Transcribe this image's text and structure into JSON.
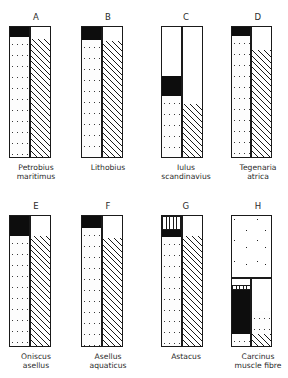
{
  "figure": {
    "type": "stacked-bar-panels",
    "panel_count": 8,
    "columns_per_panel": 2,
    "axis_range_percent": [
      0,
      100
    ]
  },
  "chart_data": {
    "type": "bar",
    "title": "",
    "subtitle": "",
    "xlabel": "",
    "ylabel": "",
    "ylim": [
      0,
      100
    ],
    "grid": false,
    "legend": [],
    "orientation": "vertical-stacked",
    "panels": [
      {
        "letter": "A",
        "species_lines": [
          "Petrobius",
          "maritimus"
        ],
        "columns": [
          {
            "side": "left",
            "segments": [
              {
                "fill": "black",
                "from": 92,
                "to": 100
              },
              {
                "fill": "stipple",
                "from": 0,
                "to": 92
              }
            ]
          },
          {
            "side": "right",
            "segments": [
              {
                "fill": "white",
                "from": 91,
                "to": 100
              },
              {
                "fill": "hatch",
                "from": 0,
                "to": 91
              }
            ]
          }
        ]
      },
      {
        "letter": "B",
        "species_lines": [
          "Lithobius"
        ],
        "columns": [
          {
            "side": "left",
            "segments": [
              {
                "fill": "black",
                "from": 90,
                "to": 100
              },
              {
                "fill": "stipple",
                "from": 0,
                "to": 90
              }
            ]
          },
          {
            "side": "right",
            "segments": [
              {
                "fill": "white",
                "from": 89,
                "to": 100
              },
              {
                "fill": "hatch",
                "from": 0,
                "to": 89
              }
            ]
          }
        ]
      },
      {
        "letter": "C",
        "species_lines": [
          "Iulus",
          "scandinavius"
        ],
        "columns": [
          {
            "side": "left",
            "segments": [
              {
                "fill": "white",
                "from": 62,
                "to": 100
              },
              {
                "fill": "black",
                "from": 47,
                "to": 62
              },
              {
                "fill": "stipple",
                "from": 0,
                "to": 47
              }
            ]
          },
          {
            "side": "right",
            "segments": [
              {
                "fill": "white",
                "from": 41,
                "to": 100
              },
              {
                "fill": "hatch",
                "from": 0,
                "to": 41
              }
            ]
          }
        ]
      },
      {
        "letter": "D",
        "species_lines": [
          "Tegenaria",
          "atrica"
        ],
        "columns": [
          {
            "side": "left",
            "segments": [
              {
                "fill": "black",
                "from": 93,
                "to": 100
              },
              {
                "fill": "stipple",
                "from": 0,
                "to": 93
              }
            ]
          },
          {
            "side": "right",
            "segments": [
              {
                "fill": "white",
                "from": 82,
                "to": 100
              },
              {
                "fill": "hatch",
                "from": 0,
                "to": 82
              }
            ]
          }
        ]
      },
      {
        "letter": "E",
        "species_lines": [
          "Oniscus",
          "asellus"
        ],
        "columns": [
          {
            "side": "left",
            "segments": [
              {
                "fill": "black",
                "from": 85,
                "to": 100
              },
              {
                "fill": "stipple",
                "from": 0,
                "to": 85
              }
            ]
          },
          {
            "side": "right",
            "segments": [
              {
                "fill": "white",
                "from": 85,
                "to": 100
              },
              {
                "fill": "hatch",
                "from": 0,
                "to": 85
              }
            ]
          }
        ]
      },
      {
        "letter": "F",
        "species_lines": [
          "Asellus",
          "aquaticus"
        ],
        "columns": [
          {
            "side": "left",
            "segments": [
              {
                "fill": "black",
                "from": 91,
                "to": 100
              },
              {
                "fill": "stipple",
                "from": 0,
                "to": 91
              }
            ]
          },
          {
            "side": "right",
            "segments": [
              {
                "fill": "white",
                "from": 83,
                "to": 100
              },
              {
                "fill": "hatch",
                "from": 0,
                "to": 83
              }
            ]
          }
        ]
      },
      {
        "letter": "G",
        "species_lines": [
          "Astacus"
        ],
        "columns": [
          {
            "side": "left",
            "segments": [
              {
                "fill": "check",
                "from": 89,
                "to": 100
              },
              {
                "fill": "black",
                "from": 84,
                "to": 89
              },
              {
                "fill": "stipple",
                "from": 0,
                "to": 84
              }
            ]
          },
          {
            "side": "right",
            "segments": [
              {
                "fill": "white",
                "from": 85,
                "to": 100
              },
              {
                "fill": "hatch",
                "from": 0,
                "to": 85
              }
            ]
          }
        ]
      },
      {
        "letter": "H",
        "species_lines": [
          "Carcinus",
          "muscle fibre"
        ],
        "full_width_top": {
          "fill": "sparse",
          "from": 52,
          "to": 100
        },
        "divider_at": 52,
        "columns": [
          {
            "side": "left",
            "segments": [
              {
                "fill": "check",
                "from": 44,
                "to": 48
              },
              {
                "fill": "black",
                "from": 9,
                "to": 44
              },
              {
                "fill": "stipple",
                "from": 0,
                "to": 9
              }
            ]
          },
          {
            "side": "right",
            "segments": [
              {
                "fill": "white",
                "from": 27,
                "to": 48
              },
              {
                "fill": "stipple",
                "from": 9,
                "to": 27
              },
              {
                "fill": "hatch",
                "from": 0,
                "to": 9
              }
            ]
          }
        ]
      }
    ]
  }
}
